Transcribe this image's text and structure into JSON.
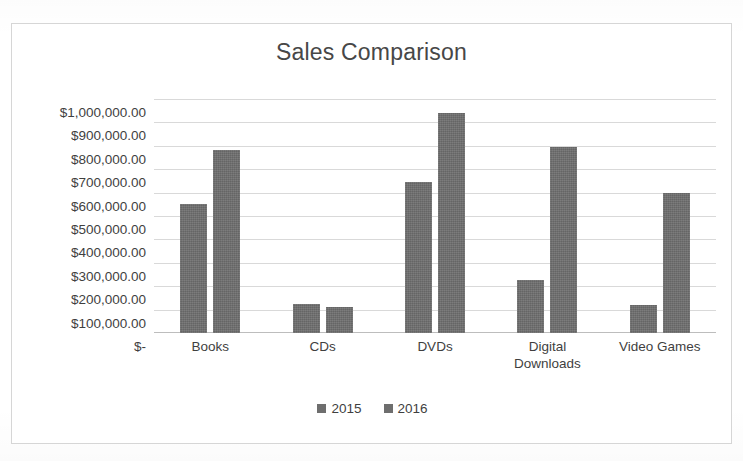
{
  "chart_data": {
    "type": "bar",
    "title": "Sales Comparison",
    "xlabel": "",
    "ylabel": "",
    "categories": [
      "Books",
      "CDs",
      "DVDs",
      "Digital\nDownloads",
      "Video Games"
    ],
    "series": [
      {
        "name": "2015",
        "values": [
          550000,
          125000,
          645000,
          225000,
          120000
        ],
        "color": "#6e6e6e"
      },
      {
        "name": "2016",
        "values": [
          780000,
          110000,
          940000,
          795000,
          600000
        ],
        "color": "#6e6e6e"
      }
    ],
    "ylim": [
      0,
      1000000
    ],
    "y_tick_values": [
      1000000,
      900000,
      800000,
      700000,
      600000,
      500000,
      400000,
      300000,
      200000,
      100000,
      0
    ],
    "y_tick_labels": [
      "$1,000,000.00",
      "$900,000.00",
      "$800,000.00",
      "$700,000.00",
      "$600,000.00",
      "$500,000.00",
      "$400,000.00",
      "$300,000.00",
      "$200,000.00",
      "$100,000.00",
      "$-"
    ],
    "grid": true,
    "legend_position": "bottom"
  },
  "chart": {
    "border_color": "#d6d6d6",
    "gridline_color": "#d9d9d9",
    "background": "#ffffff",
    "title_color": "#474747",
    "text_color": "#3f3f3f"
  }
}
